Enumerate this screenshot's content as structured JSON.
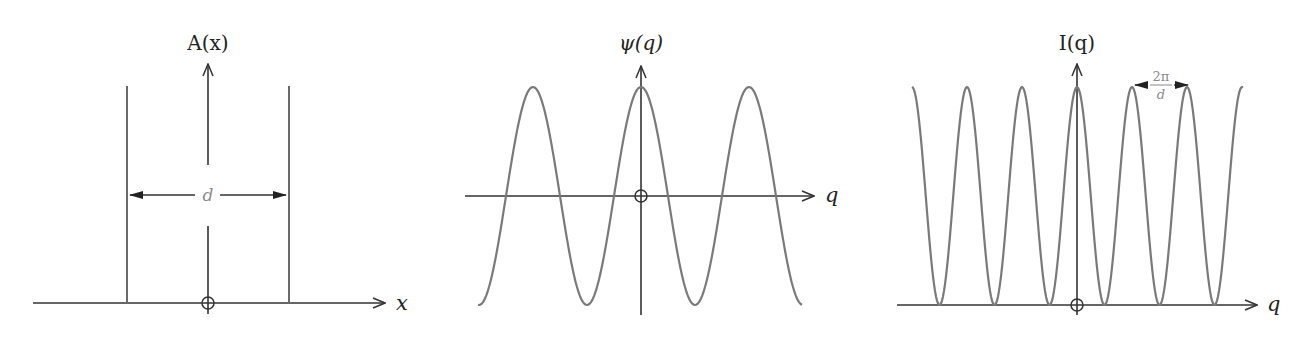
{
  "figure": {
    "panels": [
      {
        "id": "aperture",
        "y_label": "A(x)",
        "x_label": "x",
        "dimension_label": "d",
        "origin_marker": "circle-plus"
      },
      {
        "id": "amplitude",
        "y_label": "ψ(q)",
        "x_label": "q",
        "origin_marker": "circle-plus"
      },
      {
        "id": "intensity",
        "y_label": "I(q)",
        "x_label": "q",
        "period_label_num": "2π",
        "period_label_den": "d",
        "origin_marker": "circle-plus"
      }
    ],
    "colors": {
      "axis": "#333333",
      "curve": "#7a7a7a",
      "annotation": "#8a8a8a"
    }
  },
  "chart_data": [
    {
      "type": "line",
      "title": "A(x)",
      "xlabel": "x",
      "ylabel": "A(x)",
      "description": "Two delta-function slits at x = -d/2 and x = +d/2 separated by distance d",
      "series": [
        {
          "name": "A(x)",
          "x": [
            -0.5,
            0.5
          ],
          "values": [
            1,
            1
          ]
        }
      ],
      "annotations": [
        "d"
      ]
    },
    {
      "type": "line",
      "title": "ψ(q)",
      "xlabel": "q",
      "ylabel": "ψ(q)",
      "description": "Cosine amplitude cos(qd/2), 3 full oscillations shown, ranging -1 to 1",
      "series": [
        {
          "name": "ψ(q)",
          "function": "cos(q d / 2)"
        }
      ],
      "ylim": [
        -1,
        1
      ]
    },
    {
      "type": "line",
      "title": "I(q)",
      "xlabel": "q",
      "ylabel": "I(q)",
      "description": "Intensity cos²(qd/2), period 2π/d, ranging 0 to 1, 6 peaks visible",
      "series": [
        {
          "name": "I(q)",
          "function": "cos^2(q d / 2)"
        }
      ],
      "annotations": [
        "2π/d"
      ],
      "ylim": [
        0,
        1
      ]
    }
  ]
}
